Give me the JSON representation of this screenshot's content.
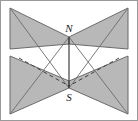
{
  "figure": {
    "name": "bowtie-planes-dipole-diagram",
    "canvas": {
      "width": 138,
      "height": 121
    },
    "background_color": "#ffffff",
    "border_color": "#9a9a9a",
    "fill_color": "#b8b8b8",
    "fill_color_shaded": "#b0b0b0",
    "stroke_color": "#6b6b6b",
    "hidden_line_color": "#4a4a4a",
    "axis_line_color": "#3c3c3c",
    "labels": {
      "north": "N",
      "south": "S"
    },
    "geometry": {
      "center_x": 69,
      "north_y": 37,
      "south_y": 88,
      "left_outer_x": 10,
      "right_outer_x": 128,
      "top_y": 8,
      "bottom_y": 114,
      "notch_left_upper_y": 49,
      "notch_left_lower_y": 56,
      "notch_right_upper_y": 49,
      "notch_right_lower_y": 56
    },
    "elements": [
      {
        "id": "plane-upper-left",
        "kind": "filled-polygon",
        "points": "10,8 69,37 69,44 10,49"
      },
      {
        "id": "plane-upper-right",
        "kind": "filled-polygon",
        "points": "128,8 69,37 69,44 128,49"
      },
      {
        "id": "plane-lower-left",
        "kind": "filled-polygon",
        "points": "10,56 69,81 69,88 10,114"
      },
      {
        "id": "plane-lower-right",
        "kind": "filled-polygon",
        "points": "128,56 69,81 69,88 128,114"
      },
      {
        "id": "axis-line",
        "kind": "solid-line",
        "from": "69,37",
        "to": "69,88"
      },
      {
        "id": "hidden-edge-left",
        "kind": "dashed-line",
        "from": "20,59",
        "to": "69,86"
      },
      {
        "id": "hidden-edge-right",
        "kind": "dashed-line",
        "from": "118,59",
        "to": "69,86"
      }
    ]
  }
}
